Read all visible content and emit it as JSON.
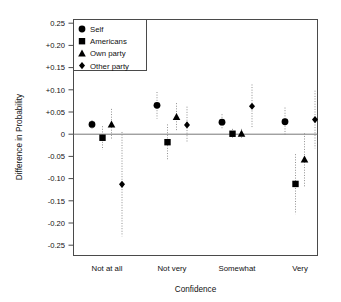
{
  "chart_data": {
    "type": "scatter",
    "title": "",
    "xlabel": "Confidence",
    "ylabel": "Difference in Probability",
    "categories": [
      "Not at all",
      "Not very",
      "Somewhat",
      "Very"
    ],
    "ylim": [
      -0.27,
      0.27
    ],
    "yticks": [
      0.25,
      0.2,
      0.15,
      0.1,
      0.05,
      0,
      -0.05,
      -0.1,
      -0.15,
      -0.2,
      -0.25
    ],
    "ytick_labels": [
      "0.25",
      "+0.20",
      "+0.15",
      "+0.10",
      "+0.05",
      "0",
      "-0.05",
      "-0.10",
      "-0.15",
      "-0.20",
      "-0.25"
    ],
    "grid": false,
    "legend_position": "top-left",
    "zero_reference_line": 0,
    "errorbar_style": "dotted vertical 95% interval",
    "series": [
      {
        "name": "Self",
        "marker": "circle",
        "values": [
          0.022,
          0.065,
          0.027,
          0.028
        ],
        "ci_low": [
          0.012,
          0.035,
          0.01,
          -0.003
        ],
        "ci_high": [
          0.032,
          0.095,
          0.045,
          0.06
        ]
      },
      {
        "name": "Americans",
        "marker": "square",
        "values": [
          -0.008,
          -0.018,
          0.001,
          -0.112
        ],
        "ci_low": [
          -0.035,
          -0.058,
          -0.01,
          -0.18
        ],
        "ci_high": [
          0.018,
          0.022,
          0.012,
          -0.045
        ]
      },
      {
        "name": "Own party",
        "marker": "triangle",
        "values": [
          0.022,
          0.039,
          0.001,
          -0.057
        ],
        "ci_low": [
          -0.012,
          0.008,
          -0.01,
          -0.118
        ],
        "ci_high": [
          0.057,
          0.07,
          0.012,
          0.002
        ]
      },
      {
        "name": "Other party",
        "marker": "diamond",
        "values": [
          -0.113,
          0.021,
          0.063,
          0.033
        ],
        "ci_low": [
          -0.23,
          -0.02,
          0.015,
          -0.032
        ],
        "ci_high": [
          0.005,
          0.062,
          0.112,
          0.098
        ]
      }
    ]
  },
  "legend": {
    "items": [
      {
        "label": "Self",
        "marker": "circle"
      },
      {
        "label": "Americans",
        "marker": "square"
      },
      {
        "label": "Own party",
        "marker": "triangle"
      },
      {
        "label": "Other party",
        "marker": "diamond"
      }
    ]
  },
  "axes": {
    "y_title": "Difference in Probability",
    "x_title": "Confidence"
  },
  "colors": {
    "marker": "#000000",
    "frame": "#4a4a4a",
    "errorbar": "#909090",
    "zero_line": "#777777",
    "background": "#ffffff"
  }
}
